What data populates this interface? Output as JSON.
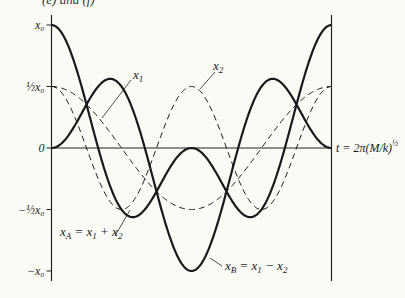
{
  "caption": "(e) and (f)",
  "chart_data": {
    "type": "line",
    "title": "",
    "xlabel": "t = 2π(M/k)^½",
    "ylabel": "",
    "x_range": [
      0,
      6.2832
    ],
    "ylim": [
      -1,
      1
    ],
    "y_ticks": [
      {
        "value": 1,
        "label": "x₀"
      },
      {
        "value": 0.5,
        "label": "½x₀"
      },
      {
        "value": 0,
        "label": "0"
      },
      {
        "value": -0.5,
        "label": "−½x₀"
      },
      {
        "value": -1,
        "label": "−x₀"
      }
    ],
    "x_end_label": "t = 2π(M/k)",
    "x_end_label_sup": "½",
    "grid": false,
    "series": [
      {
        "name": "x₁",
        "style": "dashed",
        "formula": "0.5*x0*cos(t)",
        "x": [
          0,
          1.5708,
          3.1416,
          4.7124,
          6.2832
        ],
        "values": [
          0.5,
          0,
          -0.5,
          0,
          0.5
        ]
      },
      {
        "name": "x₂",
        "style": "dashed",
        "formula": "0.5*x0*cos(2t)",
        "x": [
          0,
          1.5708,
          3.1416,
          4.7124,
          6.2832
        ],
        "values": [
          0.5,
          -0.5,
          0.5,
          -0.5,
          0.5
        ]
      },
      {
        "name": "x_A = x₁ + x₂",
        "style": "solid",
        "formula": "x1 + x2",
        "x": [
          0,
          1.8235,
          3.1416,
          4.4597,
          6.2832
        ],
        "values": [
          1,
          -0.5625,
          0,
          -0.5625,
          1
        ]
      },
      {
        "name": "x_B = x₁ − x₂",
        "style": "solid",
        "formula": "x1 - x2",
        "x": [
          0,
          1.3181,
          3.1416,
          4.9651,
          6.2832
        ],
        "values": [
          0,
          0.5625,
          -1,
          0.5625,
          0
        ]
      }
    ],
    "annotations": [
      {
        "text": "x₁",
        "points_to": "x₁ dashed curve"
      },
      {
        "text": "x₂",
        "points_to": "x₂ dashed curve peak"
      },
      {
        "text": "x_A = x₁ + x₂",
        "points_to": "x_A solid curve"
      },
      {
        "text": "x_B = x₁ − x₂",
        "points_to": "x_B solid curve"
      }
    ]
  }
}
